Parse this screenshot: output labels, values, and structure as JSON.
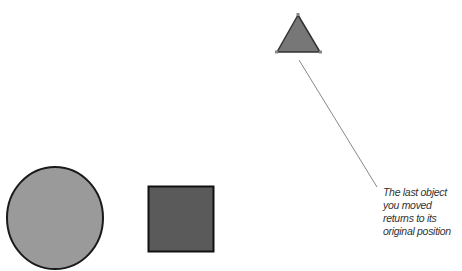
{
  "shapes": {
    "circle": {
      "label": "circle",
      "fill": "#9a9a9a",
      "stroke": "#1a1a1a"
    },
    "square": {
      "label": "square",
      "fill": "#5a5a5a",
      "stroke": "#111111"
    },
    "triangle": {
      "label": "triangle",
      "fill": "#777777",
      "stroke": "#333333"
    }
  },
  "callout": {
    "lines": [
      "The last object",
      "you moved",
      "returns to its",
      "original position"
    ],
    "line_color": "#888888"
  }
}
